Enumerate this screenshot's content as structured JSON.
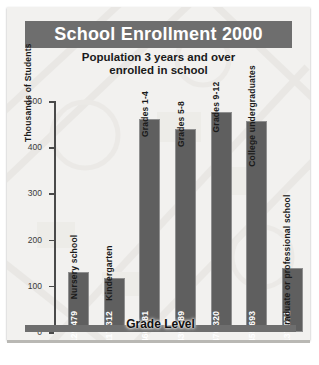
{
  "figure": {
    "title": "School Enrollment 2000",
    "subtitle_line1": "Population 3 years and over",
    "subtitle_line2": "enrolled in school"
  },
  "colors": {
    "title_band": "#6e6e6e",
    "bar_fill": "#5f5f5f",
    "paper": "#f2f1ef",
    "axis": "#4a4a4a",
    "value_text": "#ffffff",
    "category_text": "#1a1a1a"
  },
  "chart_data": {
    "type": "bar",
    "title": "School Enrollment 2000",
    "subtitle": "Population 3 years and over enrolled in school",
    "xlabel": "Grade Level",
    "ylabel": "Thousands of Students",
    "ylim": [
      0,
      500
    ],
    "yticks": [
      0,
      100,
      200,
      300,
      400,
      500
    ],
    "ytick_labels": [
      "0",
      "100",
      "200",
      "300",
      "400",
      "500"
    ],
    "grid": false,
    "legend": "none",
    "value_unit": "students",
    "categories": [
      "Nursery school",
      "Kindergarten",
      "Grades 1-4",
      "Grades 5-8",
      "Grades 9-12",
      "College undergraduates",
      "Graduate or professional school"
    ],
    "values": [
      129479,
      117312,
      460681,
      439789,
      476320,
      455693,
      137971
    ],
    "value_labels": [
      "129,479",
      "117,312",
      "460,681",
      "439,789",
      "476,320",
      "455,693",
      "137,971"
    ],
    "values_thousands": [
      129.479,
      117.312,
      460.681,
      439.789,
      476.32,
      455.693,
      137.971
    ]
  },
  "bars": [
    {
      "label": "Nursery school",
      "value_label": "129,479",
      "thousands": 129.479
    },
    {
      "label": "Kindergarten",
      "value_label": "117,312",
      "thousands": 117.312
    },
    {
      "label": "Grades 1-4",
      "value_label": "460,681",
      "thousands": 460.681
    },
    {
      "label": "Grades 5-8",
      "value_label": "439,789",
      "thousands": 439.789
    },
    {
      "label": "Grades 9-12",
      "value_label": "476,320",
      "thousands": 476.32
    },
    {
      "label": "College undergraduates",
      "value_label": "455,693",
      "thousands": 455.693
    },
    {
      "label": "Graduate or professional school",
      "value_label": "137,971",
      "thousands": 137.971
    }
  ]
}
